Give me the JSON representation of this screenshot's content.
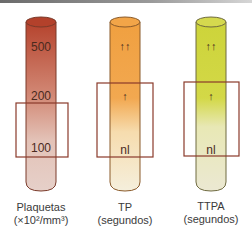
{
  "colors": {
    "platelets_top": "#b5432d",
    "platelets_bottom": "#e3cbc3",
    "tp_top": "#f0a040",
    "tp_bottom": "#f7ecd6",
    "ttpa_top": "#cdd43a",
    "ttpa_bottom": "#ece9cf",
    "box_stroke": "#8a3a2a"
  },
  "tubes": [
    {
      "id": "plaquetas",
      "markers": [
        {
          "label": "500",
          "y": 47
        },
        {
          "label": "200",
          "y": 96
        },
        {
          "label": "100",
          "y": 148
        }
      ],
      "caption_line1": "Plaquetas",
      "caption_line2": "(×10²/mm³)"
    },
    {
      "id": "tp",
      "markers": [
        {
          "label": "↑↑",
          "y": 46
        },
        {
          "label": "↑",
          "y": 96
        },
        {
          "label": "nl",
          "y": 150
        }
      ],
      "caption_line1": "TP",
      "caption_line2": "(segundos)"
    },
    {
      "id": "ttpa",
      "markers": [
        {
          "label": "↑↑",
          "y": 46
        },
        {
          "label": "↑",
          "y": 96
        },
        {
          "label": "nl",
          "y": 150
        }
      ],
      "caption_line1": "TTPA",
      "caption_line2": "(segundos)"
    }
  ]
}
